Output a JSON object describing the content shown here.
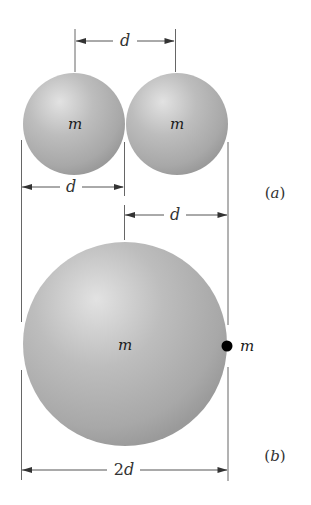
{
  "figure": {
    "colors": {
      "sphere_highlight": "#e2e2e2",
      "sphere_mid": "#b4b4b4",
      "sphere_edge": "#9a9a9a",
      "point_mass": "#000000",
      "line": "#555555"
    },
    "part_a": {
      "label_open": "(",
      "label_letter": "a",
      "label_close": ")",
      "spheres": [
        {
          "mass_label": "m"
        },
        {
          "mass_label": "m"
        }
      ],
      "dimensions": {
        "center_to_center": "d",
        "left_diameter": "d",
        "right_diameter": "d"
      }
    },
    "part_b": {
      "label_open": "(",
      "label_letter": "b",
      "label_close": ")",
      "large_sphere": {
        "mass_label": "m"
      },
      "point_mass": {
        "mass_label": "m"
      },
      "dimensions": {
        "diameter_number": "2",
        "diameter_var": "d"
      }
    }
  }
}
